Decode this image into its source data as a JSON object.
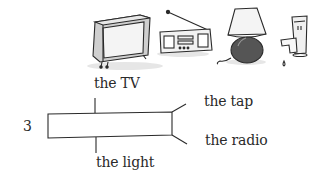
{
  "illustrations": [
    {
      "name": "tv",
      "description": "television"
    },
    {
      "name": "radio",
      "description": "radio with antenna"
    },
    {
      "name": "lamp",
      "description": "table lamp"
    },
    {
      "name": "tap",
      "description": "dripping tap"
    }
  ],
  "exercise": {
    "number": "3",
    "labels": {
      "top": "the TV",
      "bottom": "the light",
      "right_top": "the tap",
      "right_bottom": "the radio"
    }
  },
  "colors": {
    "ink": "#2a2a2a",
    "shade": "#bfbfbf",
    "dark_shade": "#555555"
  }
}
